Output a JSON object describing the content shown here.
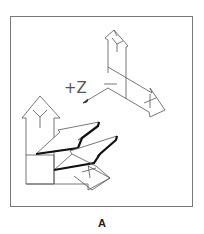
{
  "figure": {
    "caption": "A",
    "z_label": "+Z",
    "frame_color": "#777777",
    "line_color": "#555555",
    "emphasis_color": "#111111",
    "icons": [
      {
        "name": "ucs-icon-3d-view",
        "axes": [
          "X",
          "Y",
          "Z"
        ]
      },
      {
        "name": "ucs-icon-broken-pencil",
        "axes": [
          "X",
          "Y"
        ]
      }
    ]
  }
}
